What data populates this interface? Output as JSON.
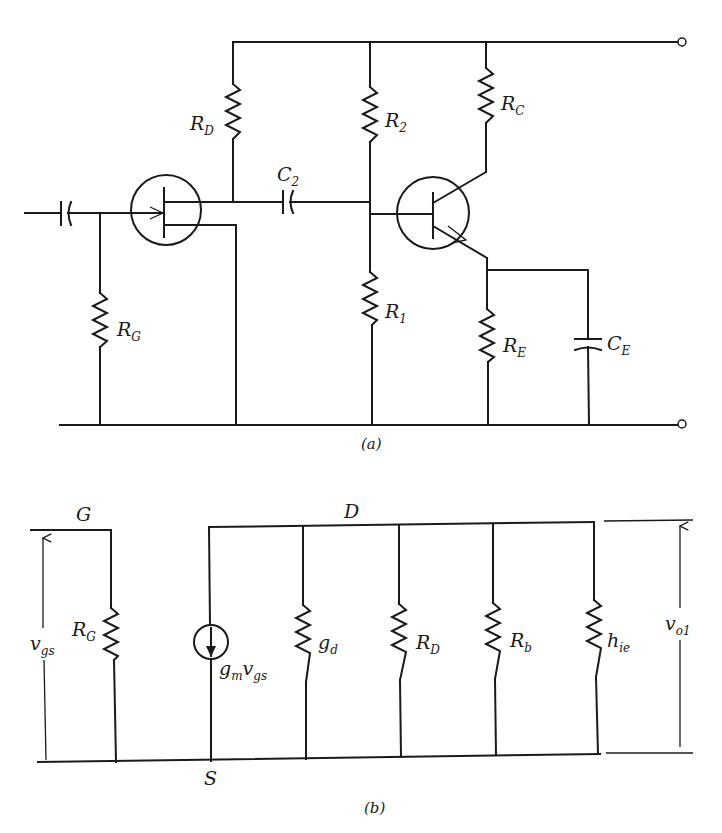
{
  "figure": {
    "part_a": {
      "caption": "(a)",
      "description": "Two-stage amplifier: JFET common-source stage RC-coupled to a BJT common-emitter stage",
      "labels": {
        "RD": {
          "main": "R",
          "sub": "D"
        },
        "R2": {
          "main": "R",
          "sub": "2"
        },
        "RC": {
          "main": "R",
          "sub": "C"
        },
        "C2": {
          "main": "C",
          "sub": "2"
        },
        "RG": {
          "main": "R",
          "sub": "G"
        },
        "R1": {
          "main": "R",
          "sub": "1"
        },
        "RE": {
          "main": "R",
          "sub": "E"
        },
        "CE": {
          "main": "C",
          "sub": "E"
        }
      }
    },
    "part_b": {
      "caption": "(b)",
      "description": "Small-signal equivalent circuit of the first stage",
      "nodes": {
        "gate": "G",
        "drain": "D",
        "source": "S"
      },
      "labels": {
        "vgs": {
          "main": "v",
          "sub": "gs"
        },
        "RG": {
          "main": "R",
          "sub": "G"
        },
        "gmvgs": {
          "main": "g",
          "sub1": "m",
          "main2": "v",
          "sub2": "gs"
        },
        "gd": {
          "main": "g",
          "sub": "d"
        },
        "RD": {
          "main": "R",
          "sub": "D"
        },
        "Rb": {
          "main": "R",
          "sub": "b"
        },
        "hie": {
          "main": "h",
          "sub": "ie"
        },
        "vo1": {
          "main": "v",
          "sub": "o1"
        }
      }
    }
  }
}
